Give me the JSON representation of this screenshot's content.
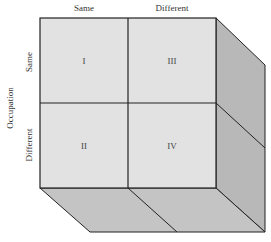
{
  "diagram": {
    "column_labels": [
      "Same",
      "Different"
    ],
    "row_axis_label": "Occupation",
    "row_labels": [
      "Same",
      "Different"
    ],
    "cells": [
      {
        "row": 0,
        "col": 0,
        "label": "I"
      },
      {
        "row": 1,
        "col": 0,
        "label": "II"
      },
      {
        "row": 0,
        "col": 1,
        "label": "III"
      },
      {
        "row": 1,
        "col": 1,
        "label": "IV"
      }
    ],
    "colors": {
      "front_face": "#e2e2e2",
      "side_face": "#b8b8b8",
      "bottom_face": "#c4c4c4",
      "edge": "#222222"
    }
  }
}
